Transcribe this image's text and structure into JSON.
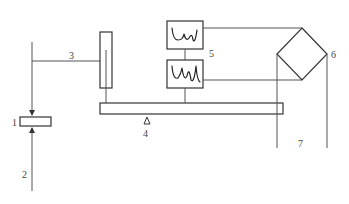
{
  "diagram": {
    "type": "schematic",
    "labels": {
      "l1": "1",
      "l2": "2",
      "l3": "3",
      "l4": "4",
      "l5": "5",
      "l6": "6",
      "l7": "7"
    },
    "components": [
      {
        "id": "1",
        "name": "target block"
      },
      {
        "id": "2",
        "name": "incoming beam"
      },
      {
        "id": "3",
        "name": "transfer line"
      },
      {
        "id": "4",
        "name": "balance beam with fulcrum"
      },
      {
        "id": "5",
        "name": "waveform display boxes"
      },
      {
        "id": "6",
        "name": "bridge (diamond)"
      },
      {
        "id": "7",
        "name": "output leads"
      }
    ],
    "colors": {
      "line": "#555555",
      "box": "#333333",
      "background": "#ffffff"
    }
  }
}
